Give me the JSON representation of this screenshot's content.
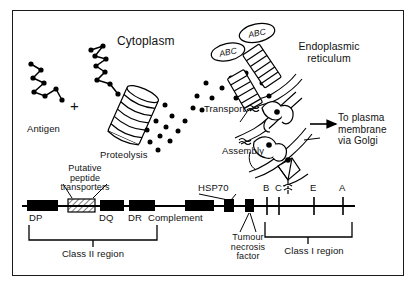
{
  "figure": {
    "border_color": "#1a1a1a",
    "ink_color": "#000000"
  },
  "cell_diagram": {
    "labels": {
      "antigen": "Antigen",
      "plus_sign": "+",
      "cytoplasm": "Cytoplasm",
      "proteolysis": "Proteolysis",
      "transporter_badge_1": "ABC",
      "transporter_badge_2": "ABC",
      "transport": "Transport",
      "assembly": "Assembly",
      "endoplasmic_reticulum": "Endoplasmic\nreticulum",
      "to_plasma_membrane": "To plasma\nmembrane\nvia Golgi"
    },
    "icons": {
      "antigen_chain": "polypeptide-chain-icon",
      "proteasome": "proteasome-barrel-icon",
      "peptide_dots": "peptide-fragment-dots-icon",
      "abc_transporter": "abc-transporter-icon",
      "mhc_molecule": "mhc-class-i-molecule-icon",
      "er_membrane": "er-membrane-icon",
      "export_arrow": "right-arrow-icon"
    }
  },
  "gene_map": {
    "axis": {
      "name": "chromosome-6-mhc-locus-line"
    },
    "loci": [
      {
        "id": "dp",
        "label": "DP",
        "type": "filled-box"
      },
      {
        "id": "peptide-transporters",
        "label": "",
        "type": "hatched-box"
      },
      {
        "id": "dq",
        "label": "DQ",
        "type": "filled-box"
      },
      {
        "id": "dr",
        "label": "DR",
        "type": "filled-box"
      },
      {
        "id": "complement",
        "label": "Complement",
        "type": "filled-box"
      },
      {
        "id": "hsp70",
        "label": "HSP70",
        "type": "filled-box"
      },
      {
        "id": "tnf",
        "label": "",
        "type": "filled-box"
      },
      {
        "id": "b",
        "label": "B",
        "type": "tick"
      },
      {
        "id": "c",
        "label": "C",
        "type": "tick"
      },
      {
        "id": "e",
        "label": "E",
        "type": "tick"
      },
      {
        "id": "a",
        "label": "A",
        "type": "tick"
      }
    ],
    "callouts": {
      "putative_peptide_transporters": "Putative\npeptide\ntransporters",
      "hsp70": "HSP70",
      "tumour_necrosis_factor": "Tumour\nnecrosis\nfactor"
    },
    "regions": [
      {
        "id": "class-ii",
        "label": "Class II region"
      },
      {
        "id": "class-i",
        "label": "Class I region"
      }
    ]
  }
}
